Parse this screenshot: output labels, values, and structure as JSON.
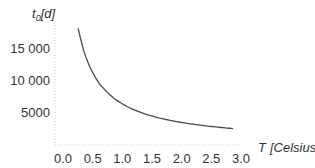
{
  "chart_data": {
    "type": "line",
    "title": "",
    "xlabel": "T [Celsius]",
    "ylabel": "t0[d]",
    "xlim": [
      0.0,
      3.0
    ],
    "ylim": [
      0,
      18000
    ],
    "grid": false,
    "legend": null,
    "x_ticks": [
      "0.0",
      "0.5",
      "1.0",
      "1.5",
      "2.0",
      "2.5",
      "3.0"
    ],
    "y_ticks": [
      "5000",
      "10000",
      "15000"
    ],
    "y_ticks_display": [
      "5000",
      "10 000",
      "15 000"
    ],
    "series": [
      {
        "name": "t0",
        "color": "#4a4a4a",
        "x": [
          0.39,
          0.5,
          0.6,
          0.75,
          1.0,
          1.25,
          1.5,
          1.75,
          2.0,
          2.25,
          2.5,
          2.75,
          3.0
        ],
        "y": [
          18000,
          14000,
          11700,
          9300,
          7000,
          5600,
          4670,
          4000,
          3500,
          3110,
          2800,
          2550,
          2330
        ]
      }
    ]
  },
  "labels": {
    "ylabel_main": "t",
    "ylabel_sub": "0",
    "ylabel_rest": "[d]",
    "xlabel_T": "T",
    "xlabel_unit": "[Celsius]"
  }
}
